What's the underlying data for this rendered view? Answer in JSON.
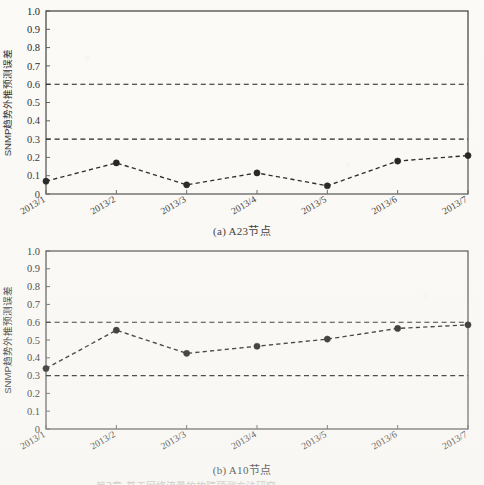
{
  "figure": {
    "background_color": "#fbfaf7",
    "ink_color": "#141414"
  },
  "panels": [
    {
      "id": "a",
      "caption_index": "(a)",
      "caption_text": "A23节点",
      "caption_full": "(a)  A23节点"
    },
    {
      "id": "b",
      "caption_index": "(b)",
      "caption_text": "A10节点",
      "caption_full": "(b)  A10节点"
    }
  ],
  "axis": {
    "ylabel": "SNMP趋势外推预测误差",
    "ytick_labels": [
      "1.0",
      "0.9",
      "0.8",
      "0.7",
      "0.6",
      "0.5",
      "0.4",
      "0.3",
      "0.2",
      "0.1",
      "0"
    ],
    "xtick_labels": [
      "2013/1",
      "2013/2",
      "2013/3",
      "2013/4",
      "2013/5",
      "2013/6",
      "2013/7"
    ]
  },
  "bottom_bleed_text": "第3章 基于网络流量的故障预测方法研究",
  "chart_data": [
    {
      "type": "line",
      "title": "(a)  A23节点",
      "xlabel": "",
      "ylabel": "SNMP趋势外推预测误差",
      "categories": [
        "2013/1",
        "2013/2",
        "2013/3",
        "2013/4",
        "2013/5",
        "2013/6",
        "2013/7"
      ],
      "values": [
        0.07,
        0.17,
        0.05,
        0.115,
        0.045,
        0.18,
        0.21
      ],
      "ylim": [
        0,
        1.0
      ],
      "ytick_step": 0.1,
      "grid": false,
      "legend": "none",
      "line_style": "dashed",
      "marker": "filled-circle",
      "reference_lines": [
        {
          "value": 0.3,
          "style": "dashed"
        },
        {
          "value": 0.6,
          "style": "dashed"
        }
      ]
    },
    {
      "type": "line",
      "title": "(b)  A10节点",
      "xlabel": "",
      "ylabel": "SNMP趋势外推预测误差",
      "categories": [
        "2013/1",
        "2013/2",
        "2013/3",
        "2013/4",
        "2013/5",
        "2013/6",
        "2013/7"
      ],
      "values": [
        0.34,
        0.555,
        0.425,
        0.465,
        0.505,
        0.565,
        0.585
      ],
      "ylim": [
        0,
        1.0
      ],
      "ytick_step": 0.1,
      "grid": false,
      "legend": "none",
      "line_style": "dashed",
      "marker": "filled-circle",
      "reference_lines": [
        {
          "value": 0.3,
          "style": "dashed"
        },
        {
          "value": 0.6,
          "style": "dashed"
        }
      ]
    }
  ]
}
